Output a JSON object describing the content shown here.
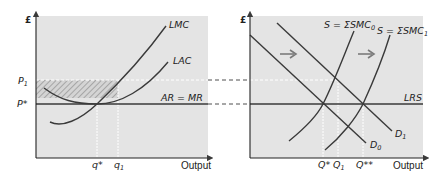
{
  "figure": {
    "left_panel": {
      "y_axis_label": "£",
      "x_axis_label": "Output",
      "price_labels": {
        "p1": "P",
        "p1_sub": "1",
        "pstar": "P*"
      },
      "quantity_labels": {
        "qstar": "q*",
        "q1": "q",
        "q1_sub": "1"
      },
      "curves": {
        "lmc": "LMC",
        "lac": "LAC",
        "ar_mr": "AR = MR"
      }
    },
    "right_panel": {
      "y_axis_label": "£",
      "x_axis_label": "Output",
      "quantity_labels": {
        "qstar": "Q*",
        "q1": "Q",
        "q1_sub": "1",
        "qstarstar": "Q**"
      },
      "curves": {
        "s0": "S = ΣSMC",
        "s0_sub": "0",
        "s1": "S = ΣSMC",
        "s1_sub": "1",
        "lrs": "LRS",
        "d0": "D",
        "d0_sub": "0",
        "d1": "D",
        "d1_sub": "1"
      },
      "arrows": [
        "right-arrow",
        "right-arrow"
      ]
    },
    "colors": {
      "panel_bg": "#e4e4e4",
      "line": "#3a3a3a",
      "hatch": "#9a9a9a",
      "guide_white": "#ffffff",
      "arrow": "#7a7a7a"
    }
  }
}
